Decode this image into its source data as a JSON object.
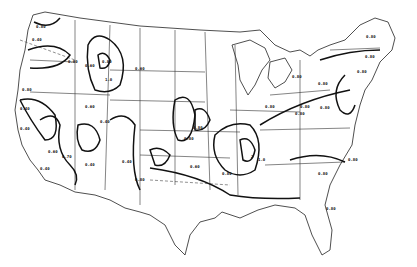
{
  "map": {
    "type": "contour map of contiguous United States",
    "style": "black and white line drawing",
    "contour_labels": [
      {
        "text": "0.80",
        "x": 36,
        "y": 25
      },
      {
        "text": "0.40",
        "x": 32,
        "y": 38
      },
      {
        "text": "0.80",
        "x": 68,
        "y": 60
      },
      {
        "text": "0.60",
        "x": 85,
        "y": 64
      },
      {
        "text": "0.80",
        "x": 102,
        "y": 60
      },
      {
        "text": "1.0",
        "x": 105,
        "y": 78
      },
      {
        "text": "0.60",
        "x": 135,
        "y": 67
      },
      {
        "text": "0.80",
        "x": 22,
        "y": 88
      },
      {
        "text": "0.40",
        "x": 20,
        "y": 107
      },
      {
        "text": "0.60",
        "x": 85,
        "y": 105
      },
      {
        "text": "0.40",
        "x": 100,
        "y": 120
      },
      {
        "text": "0.40",
        "x": 20,
        "y": 127
      },
      {
        "text": "0.60",
        "x": 48,
        "y": 150
      },
      {
        "text": "0.70",
        "x": 62,
        "y": 155
      },
      {
        "text": "0.40",
        "x": 40,
        "y": 167
      },
      {
        "text": "0.40",
        "x": 85,
        "y": 163
      },
      {
        "text": "0.40",
        "x": 122,
        "y": 160
      },
      {
        "text": "0.80",
        "x": 135,
        "y": 178
      },
      {
        "text": "0.80",
        "x": 184,
        "y": 137
      },
      {
        "text": "0.80",
        "x": 193,
        "y": 126
      },
      {
        "text": "0.60",
        "x": 190,
        "y": 165
      },
      {
        "text": "2",
        "x": 251,
        "y": 155
      },
      {
        "text": "1.0",
        "x": 258,
        "y": 158
      },
      {
        "text": "0.80",
        "x": 292,
        "y": 75
      },
      {
        "text": "0.80",
        "x": 265,
        "y": 105
      },
      {
        "text": "0.80",
        "x": 318,
        "y": 82
      },
      {
        "text": "0.80",
        "x": 320,
        "y": 106
      },
      {
        "text": "0.80",
        "x": 300,
        "y": 105
      },
      {
        "text": "0.80",
        "x": 366,
        "y": 35
      },
      {
        "text": "0.80",
        "x": 365,
        "y": 55
      },
      {
        "text": "0.80",
        "x": 357,
        "y": 70
      },
      {
        "text": "0.80",
        "x": 348,
        "y": 158
      },
      {
        "text": "0.80",
        "x": 318,
        "y": 172
      },
      {
        "text": "0.80",
        "x": 326,
        "y": 207
      },
      {
        "text": "0.80",
        "x": 295,
        "y": 112
      },
      {
        "text": "0.80",
        "x": 222,
        "y": 172
      }
    ]
  }
}
